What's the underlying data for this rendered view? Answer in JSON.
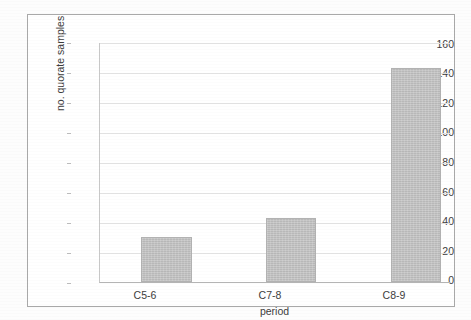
{
  "chart_data": {
    "type": "bar",
    "title": "",
    "categories": [
      "C5-6",
      "C7-8",
      "C8-9"
    ],
    "values": [
      30,
      43,
      143
    ],
    "series": [
      {
        "name": "no. quorate samples",
        "values": [
          30,
          43,
          143
        ]
      }
    ],
    "xlabel": "period",
    "ylabel": "no. quorate samples",
    "ylim": [
      0,
      160
    ],
    "ytick_step": 20,
    "yticks": [
      "160",
      "140",
      "120",
      "100",
      "80",
      "60",
      "40",
      "20",
      "0"
    ],
    "ytick_values": [
      160,
      140,
      120,
      100,
      80,
      60,
      40,
      20,
      0
    ],
    "grid": true,
    "legend": false,
    "legend_position": "none",
    "bar_color": "#bfbfbf",
    "bar_border_color": "#b2b2b2",
    "gridline_color": "#e4e4e4",
    "axis_color": "#b4b4b4",
    "frame_color": "#a9a9a9",
    "background_color": "#ffffff"
  }
}
